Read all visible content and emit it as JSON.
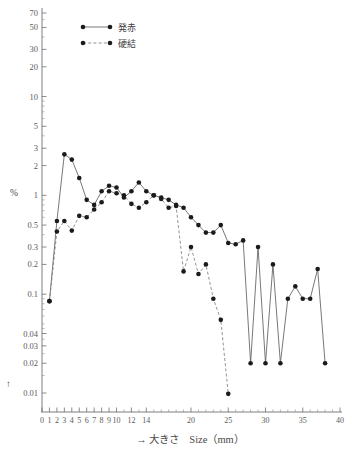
{
  "header": {
    "cropped_top_text": "",
    "percent_symbol": "%",
    "up_arrow": "↑"
  },
  "legend": {
    "position": "top-left-inside",
    "items": [
      {
        "label": "発赤",
        "style": "solid",
        "marker": "circle"
      },
      {
        "label": "硬結",
        "style": "dashed",
        "marker": "circle"
      }
    ]
  },
  "chart_data": {
    "type": "line",
    "title": "",
    "subtitle": "",
    "xlabel": "→ 大きさ　Size（mm）",
    "ylabel": "%",
    "yscale": "log",
    "ylim": [
      0.0085,
      75
    ],
    "xlim": [
      0,
      40
    ],
    "grid": false,
    "legend_position": "upper-left",
    "ytick_values": [
      70,
      50,
      30,
      20,
      10,
      5,
      3,
      2,
      1,
      0.5,
      0.3,
      0.2,
      0.1,
      0.04,
      0.03,
      0.02,
      0.01
    ],
    "ytick_labels": [
      "70",
      "50",
      "30",
      "20",
      "10",
      "5",
      "3",
      "2",
      "1",
      "0.5",
      "0.3",
      "0.2",
      "0.1",
      "0.04",
      "0.03",
      "0.02",
      "0.01"
    ],
    "xtick_values": [
      0,
      1,
      2,
      3,
      4,
      5,
      6,
      7,
      8,
      9,
      10,
      12,
      14,
      20,
      25,
      30,
      35,
      40
    ],
    "xtick_labels": [
      "0",
      "1",
      "2",
      "3",
      "4",
      "5",
      "6",
      "7",
      "8",
      "9",
      "10",
      "12",
      "14",
      "20",
      "25",
      "30",
      "35",
      "40"
    ],
    "xtick_minor": [
      11,
      13,
      15,
      16,
      17,
      18,
      19,
      21,
      22,
      23,
      24,
      26,
      27,
      28,
      29,
      31,
      32,
      33,
      34,
      36,
      37,
      38,
      39
    ],
    "series": [
      {
        "name": "発赤",
        "style": "solid",
        "x": [
          1,
          2,
          3,
          4,
          5,
          6,
          7,
          8,
          9,
          10,
          11,
          12,
          13,
          14,
          15,
          16,
          17,
          18,
          19,
          20,
          21,
          22,
          23,
          24,
          25,
          26,
          27,
          28,
          29,
          30,
          31,
          32,
          33,
          34,
          35,
          36,
          37,
          38
        ],
        "y": [
          0.085,
          0.55,
          2.6,
          2.3,
          1.5,
          0.9,
          0.8,
          1.1,
          1.25,
          1.2,
          0.95,
          1.1,
          1.35,
          1.1,
          1.0,
          0.95,
          0.9,
          0.8,
          0.75,
          0.6,
          0.5,
          0.42,
          0.42,
          0.5,
          0.33,
          0.32,
          0.35,
          0.02,
          0.3,
          0.02,
          0.2,
          0.02,
          0.09,
          0.12,
          0.09,
          0.09,
          0.18,
          0.02
        ]
      },
      {
        "name": "硬結",
        "style": "dashed",
        "x": [
          1,
          2,
          3,
          4,
          5,
          6,
          7,
          8,
          9,
          10,
          11,
          12,
          13,
          14,
          15,
          16,
          17,
          18,
          19,
          20,
          21,
          22,
          23,
          24,
          25
        ],
        "y": [
          0.085,
          0.43,
          0.55,
          0.44,
          0.62,
          0.6,
          0.72,
          0.85,
          1.1,
          1.05,
          1.0,
          0.82,
          0.75,
          0.85,
          1.0,
          0.92,
          0.75,
          0.78,
          0.17,
          0.3,
          0.16,
          0.2,
          0.09,
          0.055,
          0.0098
        ]
      }
    ]
  }
}
